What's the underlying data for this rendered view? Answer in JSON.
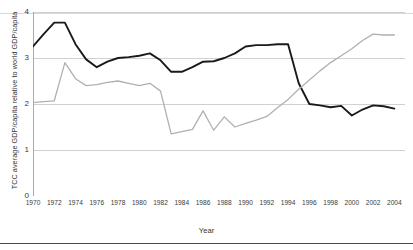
{
  "chart_data": {
    "type": "line",
    "title": "",
    "xlabel": "Year",
    "ylabel": "TCC average GDP/capita relative to world GDP/capita",
    "xlim": [
      1970,
      2005
    ],
    "ylim": [
      0,
      4
    ],
    "yticks": [
      0,
      1,
      2,
      3,
      4
    ],
    "xticks": [
      1970,
      1971,
      1972,
      1973,
      1974,
      1975,
      1976,
      1977,
      1978,
      1979,
      1980,
      1981,
      1982,
      1983,
      1984,
      1985,
      1986,
      1987,
      1988,
      1989,
      1990,
      1991,
      1992,
      1993,
      1994,
      1995,
      1996,
      1997,
      1998,
      1999,
      2000,
      2001,
      2002,
      2003,
      2004
    ],
    "xticklabels": [
      "1970",
      "1972",
      "1974",
      "1976",
      "1978",
      "1980",
      "1982",
      "1984",
      "1986",
      "1988",
      "1990",
      "1992",
      "1994",
      "1996",
      "1998",
      "2000",
      "2002",
      "2004"
    ],
    "xticklabel_years": [
      1970,
      1972,
      1974,
      1976,
      1978,
      1980,
      1982,
      1984,
      1986,
      1988,
      1990,
      1992,
      1994,
      1996,
      1998,
      2000,
      2002,
      2004
    ],
    "grid": "horizontal",
    "legend": "none",
    "x": [
      1970,
      1971,
      1972,
      1973,
      1974,
      1975,
      1976,
      1977,
      1978,
      1979,
      1980,
      1981,
      1982,
      1983,
      1984,
      1985,
      1986,
      1987,
      1988,
      1989,
      1990,
      1991,
      1992,
      1993,
      1994,
      1995,
      1996,
      1997,
      1998,
      1999,
      2000,
      2001,
      2002,
      2003,
      2004
    ],
    "series": [
      {
        "name": "dark-line",
        "color": "#1a1a1a",
        "width": 1.9,
        "values": [
          3.25,
          3.52,
          3.77,
          3.77,
          3.3,
          2.97,
          2.8,
          2.92,
          3.0,
          3.02,
          3.05,
          3.1,
          2.95,
          2.7,
          2.7,
          2.8,
          2.92,
          2.93,
          3.0,
          3.1,
          3.25,
          3.28,
          3.28,
          3.3,
          3.3,
          2.45,
          2.0,
          1.97,
          1.93,
          1.96,
          1.75,
          1.88,
          1.97,
          1.95,
          1.9
        ]
      },
      {
        "name": "gray-line",
        "color": "#b0b0b0",
        "width": 1.3,
        "values": [
          2.03,
          2.05,
          2.07,
          2.9,
          2.55,
          2.4,
          2.42,
          2.47,
          2.5,
          2.45,
          2.4,
          2.45,
          2.28,
          1.35,
          1.4,
          1.45,
          1.85,
          1.43,
          1.72,
          1.5,
          1.58,
          1.65,
          1.73,
          1.92,
          2.1,
          2.32,
          2.52,
          2.72,
          2.9,
          3.05,
          3.2,
          3.38,
          3.52,
          3.5,
          3.5
        ]
      }
    ],
    "series_full": {
      "dark": [
        {
          "year": 1970,
          "value": 3.25
        },
        {
          "year": 1971,
          "value": 3.52
        },
        {
          "year": 1972,
          "value": 3.77
        },
        {
          "year": 1973,
          "value": 3.77
        },
        {
          "year": 1974,
          "value": 3.3
        },
        {
          "year": 1975,
          "value": 2.97
        },
        {
          "year": 1976,
          "value": 2.8
        },
        {
          "year": 1977,
          "value": 2.92
        },
        {
          "year": 1978,
          "value": 3.0
        },
        {
          "year": 1979,
          "value": 3.02
        },
        {
          "year": 1980,
          "value": 3.05
        },
        {
          "year": 1981,
          "value": 3.1
        },
        {
          "year": 1982,
          "value": 2.95
        },
        {
          "year": 1983,
          "value": 2.7
        },
        {
          "year": 1984,
          "value": 2.7
        },
        {
          "year": 1985,
          "value": 2.8
        },
        {
          "year": 1986,
          "value": 2.92
        },
        {
          "year": 1987,
          "value": 2.93
        },
        {
          "year": 1988,
          "value": 3.0
        },
        {
          "year": 1989,
          "value": 3.1
        },
        {
          "year": 1990,
          "value": 3.25
        },
        {
          "year": 1991,
          "value": 3.28
        },
        {
          "year": 1992,
          "value": 3.28
        },
        {
          "year": 1993,
          "value": 3.3
        },
        {
          "year": 1994,
          "value": 3.3
        },
        {
          "year": 1995,
          "value": 2.45
        },
        {
          "year": 1996,
          "value": 2.0
        },
        {
          "year": 1997,
          "value": 1.97
        },
        {
          "year": 1998,
          "value": 1.93
        },
        {
          "year": 1999,
          "value": 1.96
        },
        {
          "year": 2000,
          "value": 1.75
        },
        {
          "year": 2001,
          "value": 1.88
        },
        {
          "year": 2002,
          "value": 1.97
        },
        {
          "year": 2003,
          "value": 1.95
        },
        {
          "year": 2004,
          "value": 1.9
        }
      ],
      "gray": [
        {
          "year": 1970,
          "value": 2.03
        },
        {
          "year": 1971,
          "value": 2.05
        },
        {
          "year": 1972,
          "value": 2.07
        },
        {
          "year": 1973,
          "value": 2.9
        },
        {
          "year": 1974,
          "value": 2.55
        },
        {
          "year": 1975,
          "value": 2.4
        },
        {
          "year": 1976,
          "value": 2.42
        },
        {
          "year": 1977,
          "value": 2.47
        },
        {
          "year": 1978,
          "value": 2.5
        },
        {
          "year": 1979,
          "value": 2.45
        },
        {
          "year": 1980,
          "value": 2.4
        },
        {
          "year": 1981,
          "value": 2.45
        },
        {
          "year": 1982,
          "value": 2.28
        },
        {
          "year": 1983,
          "value": 1.35
        },
        {
          "year": 1984,
          "value": 1.4
        },
        {
          "year": 1985,
          "value": 1.45
        },
        {
          "year": 1986,
          "value": 1.85
        },
        {
          "year": 1987,
          "value": 1.43
        },
        {
          "year": 1988,
          "value": 1.72
        },
        {
          "year": 1989,
          "value": 1.5
        },
        {
          "year": 1990,
          "value": 1.58
        },
        {
          "year": 1991,
          "value": 1.65
        },
        {
          "year": 1992,
          "value": 1.73
        },
        {
          "year": 1993,
          "value": 1.92
        },
        {
          "year": 1994,
          "value": 2.1
        },
        {
          "year": 1995,
          "value": 2.32
        },
        {
          "year": 1996,
          "value": 2.52
        },
        {
          "year": 1997,
          "value": 2.72
        },
        {
          "year": 1998,
          "value": 2.9
        },
        {
          "year": 1999,
          "value": 3.05
        },
        {
          "year": 2000,
          "value": 3.2
        },
        {
          "year": 2001,
          "value": 3.38
        },
        {
          "year": 2002,
          "value": 3.52
        },
        {
          "year": 2003,
          "value": 3.5
        },
        {
          "year": 2004,
          "value": 3.5
        }
      ]
    },
    "colors": {
      "dark_series": "#1a1a1a",
      "gray_series": "#b0b0b0",
      "gridline": "#d0d0d0",
      "axis": "#aaaaaa",
      "text": "#333333",
      "background": "#ffffff",
      "bottom_rule": "#4a4a4a",
      "top_rule": "#d8d8d8"
    }
  }
}
